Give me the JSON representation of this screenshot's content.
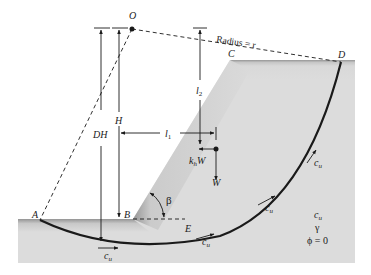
{
  "labels": {
    "O": "O",
    "A": "A",
    "B": "B",
    "C": "C",
    "D": "D",
    "E": "E",
    "radius": "Radius = r",
    "H": "H",
    "DH": "DH",
    "l1": "l",
    "l1_sub": "1",
    "l2": "l",
    "l2_sub": "2",
    "khW_k": "k",
    "khW_sub": "h",
    "khW_W": "W",
    "W": "W",
    "beta": "β",
    "cu_c": "c",
    "cu_sub": "u",
    "props_cu_c": "c",
    "props_cu_sub": "u",
    "props_gamma": "γ",
    "props_phi": "ϕ = 0"
  },
  "colors": {
    "soil_light": "#dcdcdc",
    "soil_dark": "#9a9a9a",
    "line": "#1a1a1a",
    "background": "#ffffff"
  }
}
